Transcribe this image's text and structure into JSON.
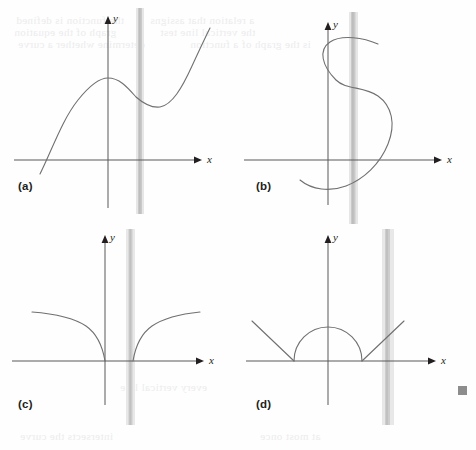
{
  "figure": {
    "caption_style": "vertical-line-test",
    "background_color": "#fefefe",
    "curve_color": "#6f7072",
    "axis_color": "#58585b",
    "highlight_color": "#c9c9c9",
    "highlight_edge_color": "#e4e4e4",
    "label_color": "#231f20",
    "end_marker_color": "#8d8d8d"
  },
  "axes": {
    "x_label": "x",
    "y_label": "y"
  },
  "panels": [
    {
      "id": "a",
      "label": "(a)",
      "curve_name": "cubic-with-local-max-and-min",
      "description": "Cubic-like curve rising from lower left to a local maximum left of the y-axis, dipping to a local minimum right of the vertical line, then rising steeply.",
      "vertical_line_x": 140,
      "crosses_vertical_line_times": 1,
      "passes_vertical_line_test": true,
      "origin": {
        "x": 108,
        "y": 160
      },
      "x_axis": {
        "x1": 14,
        "x2": 198,
        "y": 160
      },
      "y_axis": {
        "x": 108,
        "y1": 18,
        "y2": 208
      }
    },
    {
      "id": "b",
      "label": "(b)",
      "curve_name": "sideways-s-curve",
      "description": "S-shaped sideways curve entering from lower left, bulging right below the axis, bending back left, then exiting to the upper right.",
      "vertical_line_x": 115,
      "crosses_vertical_line_times": 3,
      "passes_vertical_line_test": false,
      "origin": {
        "x": 90,
        "y": 160
      },
      "x_axis": {
        "x1": 6,
        "x2": 200,
        "y": 160
      },
      "y_axis": {
        "x": 90,
        "y1": 22,
        "y2": 205
      }
    },
    {
      "id": "c",
      "label": "(c)",
      "curve_name": "two-branch-root-curves",
      "description": "Two symmetric branches with vertical tangents at the x-axis rising outward to the left and right.",
      "vertical_line_x": 131,
      "crosses_vertical_line_times": 1,
      "passes_vertical_line_test": true,
      "origin": {
        "x": 105,
        "y": 136
      },
      "x_axis": {
        "x1": 12,
        "x2": 200,
        "y": 136
      },
      "y_axis": {
        "x": 105,
        "y1": 8,
        "y2": 185
      }
    },
    {
      "id": "d",
      "label": "(d)",
      "curve_name": "semicircle-with-two-rays",
      "description": "Semicircle sitting on the x-axis centred on the y-axis, with straight rays angling up-left and up-right from its endpoints.",
      "vertical_line_x": 150,
      "crosses_vertical_line_times": 1,
      "passes_vertical_line_test": true,
      "origin": {
        "x": 90,
        "y": 136
      },
      "x_axis": {
        "x1": 8,
        "x2": 200,
        "y": 136
      },
      "y_axis": {
        "x": 90,
        "y1": 8,
        "y2": 185
      }
    }
  ],
  "ghost_text": [
    {
      "text": "the function is defined",
      "left": 16,
      "top": 14
    },
    {
      "text": "a relation that assigns",
      "left": 150,
      "top": 14
    },
    {
      "text": "graph of the equation",
      "left": 14,
      "top": 26
    },
    {
      "text": "the vertical line test",
      "left": 160,
      "top": 26
    },
    {
      "text": "determine whether a curve",
      "left": 18,
      "top": 38
    },
    {
      "text": "is the graph of a function",
      "left": 190,
      "top": 38
    },
    {
      "text": "every vertical line",
      "left": 120,
      "top": 381
    },
    {
      "text": "intersects the curve",
      "left": 20,
      "top": 430
    },
    {
      "text": "at most once",
      "left": 260,
      "top": 430
    }
  ],
  "end_marker": {
    "name": "end-of-section-marker",
    "shape": "square"
  }
}
